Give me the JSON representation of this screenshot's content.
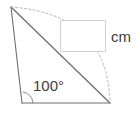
{
  "figure": {
    "type": "geometry-diagram",
    "width": 136,
    "height": 117,
    "background_color": "#ffffff",
    "stroke_color": "#6e6e6e",
    "dash_color": "#b8b8b8",
    "text_color": "#3d3d3d",
    "box_border_color": "#d0d0d0"
  },
  "angle": {
    "label": "100°",
    "value": 100,
    "unit": "degrees",
    "vertex": "bottom-left"
  },
  "answer": {
    "value": "",
    "placeholder": "",
    "unit_label": "cm"
  },
  "points": {
    "apex": {
      "x": 11,
      "y": 7
    },
    "bottom_left": {
      "x": 22,
      "y": 103
    },
    "bottom_right": {
      "x": 110,
      "y": 103
    }
  },
  "segments": [
    {
      "name": "left-side",
      "from": "apex",
      "to": "bottom_left",
      "style": "solid"
    },
    {
      "name": "base",
      "from": "bottom_left",
      "to": "bottom_right",
      "style": "solid"
    },
    {
      "name": "diagonal",
      "from": "apex",
      "to": "bottom_right",
      "style": "solid"
    },
    {
      "name": "arc",
      "from": "apex",
      "to": "bottom_right",
      "style": "dashed"
    }
  ]
}
